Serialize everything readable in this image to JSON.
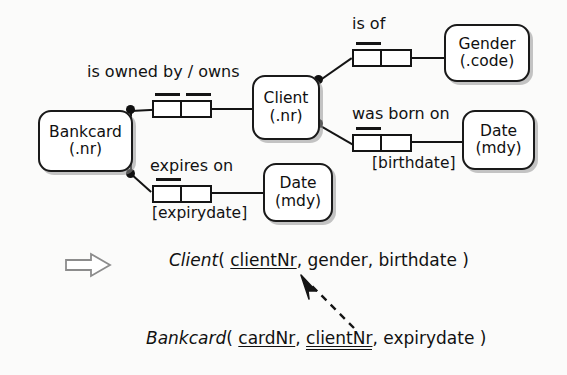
{
  "diagram": {
    "type": "orm-conceptual-schema",
    "title": "",
    "entities": [
      {
        "id": "bankcard",
        "name": "Bankcard",
        "reference_mode": "(.nr)"
      },
      {
        "id": "client",
        "name": "Client",
        "reference_mode": "(.nr)"
      },
      {
        "id": "gender",
        "name": "Gender",
        "reference_mode": "(.code)"
      },
      {
        "id": "date_birth",
        "name": "Date",
        "reference_mode": "(mdy)"
      },
      {
        "id": "date_expiry",
        "name": "Date",
        "reference_mode": "(mdy)"
      }
    ],
    "predicates": [
      {
        "id": "owns",
        "reading": "is owned by / owns",
        "role_note": "",
        "roles": 2,
        "uniqueness": "both-roles"
      },
      {
        "id": "is_of",
        "reading": "is of",
        "role_note": "",
        "roles": 2,
        "uniqueness": "left-role"
      },
      {
        "id": "was_born_on",
        "reading": "was born on",
        "role_note": "[birthdate]",
        "roles": 2,
        "uniqueness": "left-role"
      },
      {
        "id": "expires_on",
        "reading": "expires on",
        "role_note": "[expirydate]",
        "roles": 2,
        "uniqueness": "left-role"
      }
    ]
  },
  "schema": {
    "client": {
      "relation": "Client",
      "open_paren": "(",
      "close_paren": ")",
      "attributes": [
        {
          "name": "clientNr",
          "key": "primary"
        },
        {
          "name": "gender",
          "key": "none"
        },
        {
          "name": "birthdate",
          "key": "none"
        }
      ],
      "rendered": "Client ( clientNr, gender, birthdate )"
    },
    "bankcard": {
      "relation": "Bankcard",
      "open_paren": "(",
      "close_paren": ")",
      "attributes": [
        {
          "name": "cardNr",
          "key": "primary"
        },
        {
          "name": "clientNr",
          "key": "foreign"
        },
        {
          "name": "expirydate",
          "key": "none"
        }
      ],
      "rendered": "Bankcard ( cardNr, clientNr, expirydate )"
    },
    "separator_comma": ",",
    "maps_to_icon": "block-right-arrow",
    "reference_arrow_icon": "dashed-arrow"
  },
  "colors": {
    "stroke": "#141414",
    "text": "#111111",
    "page": "#fbfbfa",
    "shadow": "#969696"
  }
}
